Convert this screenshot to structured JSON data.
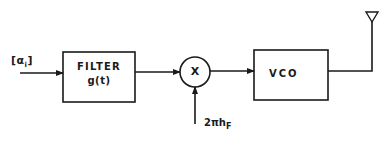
{
  "diagram": {
    "type": "block-diagram",
    "input": {
      "label": "[α",
      "subscript": "i",
      "close": "]"
    },
    "blocks": [
      {
        "id": "filter",
        "line1": "FILTER",
        "line2": "g(t)"
      },
      {
        "id": "multiplier",
        "symbol": "X"
      },
      {
        "id": "vco",
        "label": "VCO"
      }
    ],
    "multiplier_input": {
      "label": "2πh",
      "subscript": "F"
    },
    "output": {
      "icon": "antenna-icon"
    },
    "colors": {
      "stroke": "#1a1a1a",
      "background": "#ffffff"
    }
  }
}
